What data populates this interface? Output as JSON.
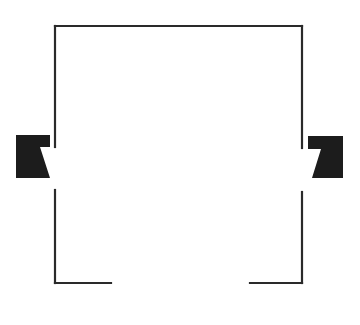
{
  "diagram": {
    "type": "floor-plan",
    "stroke_color": "#2a2a2a",
    "fill_color": "#1c1c1c",
    "background": "#ffffff",
    "walls": [
      {
        "name": "top-wall",
        "x1": 55,
        "y1": 26,
        "x2": 302,
        "y2": 26
      },
      {
        "name": "left-wall-upper",
        "x1": 55,
        "y1": 26,
        "x2": 55,
        "y2": 147
      },
      {
        "name": "left-wall-lower",
        "x1": 55,
        "y1": 190,
        "x2": 55,
        "y2": 283
      },
      {
        "name": "right-wall-upper",
        "x1": 302,
        "y1": 26,
        "x2": 302,
        "y2": 148
      },
      {
        "name": "right-wall-lower",
        "x1": 302,
        "y1": 192,
        "x2": 302,
        "y2": 283
      },
      {
        "name": "bottom-wall-left",
        "x1": 55,
        "y1": 283,
        "x2": 111,
        "y2": 283
      },
      {
        "name": "bottom-wall-right",
        "x1": 250,
        "y1": 283,
        "x2": 302,
        "y2": 283
      }
    ],
    "openings": [
      {
        "name": "left-side-opening",
        "side": "left",
        "y_from": 147,
        "y_to": 190
      },
      {
        "name": "right-side-opening",
        "side": "right",
        "y_from": 148,
        "y_to": 192
      },
      {
        "name": "bottom-opening",
        "side": "bottom",
        "x_from": 111,
        "x_to": 250
      }
    ],
    "markers": [
      {
        "name": "left-speaker-marker",
        "side": "left",
        "points": "16,135 50,135 50,147 40,147 50,178 16,178"
      },
      {
        "name": "right-speaker-marker",
        "side": "right",
        "points": "308,136 343,136 343,178 312,178 321,149 308,149"
      }
    ]
  }
}
